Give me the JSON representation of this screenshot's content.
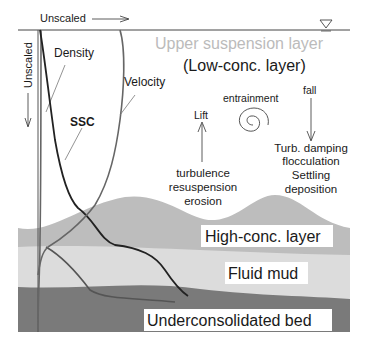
{
  "axes": {
    "horizontal_label": "Unscaled",
    "vertical_label": "Unscaled"
  },
  "water_surface_symbol": "water-level-triangle",
  "profiles": [
    {
      "name": "Density",
      "label": "Density"
    },
    {
      "name": "SSC",
      "label": "SSC"
    },
    {
      "name": "Velocity",
      "label": "Velocity"
    }
  ],
  "layers": {
    "upper": {
      "title": "Upper suspension layer",
      "subtitle": "(Low-conc. layer)",
      "color": "#ffffff"
    },
    "high_conc": {
      "title": "High-conc. layer",
      "color": "#bdbdbd"
    },
    "fluid_mud": {
      "title": "Fluid mud",
      "color": "#dcdcdc"
    },
    "bed": {
      "title": "Underconsolidated bed",
      "color": "#7a7a7a"
    }
  },
  "processes": {
    "entrainment": "entrainment",
    "lift": "Lift",
    "fall": "fall",
    "upward": [
      "turbulence",
      "resuspension",
      "erosion"
    ],
    "downward": [
      "Turb. damping",
      "flocculation",
      "Settling",
      "deposition"
    ]
  }
}
